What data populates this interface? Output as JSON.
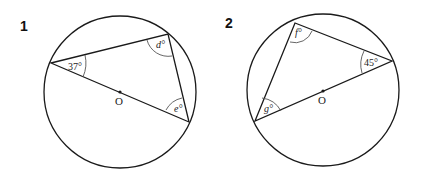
{
  "diagrams": [
    {
      "number": "1",
      "center_label": "O",
      "angles": {
        "left": "37°",
        "top_right": "d°",
        "bottom_right": "e°"
      },
      "known_angle_value": 37,
      "unknowns": [
        "d",
        "e"
      ]
    },
    {
      "number": "2",
      "center_label": "O",
      "angles": {
        "top": "f°",
        "right": "45°",
        "bottom_left": "g°"
      },
      "known_angle_value": 45,
      "unknowns": [
        "f",
        "g"
      ]
    }
  ],
  "colors": {
    "stroke": "#1a1a1a",
    "arc": "#555555",
    "background": "#ffffff"
  }
}
